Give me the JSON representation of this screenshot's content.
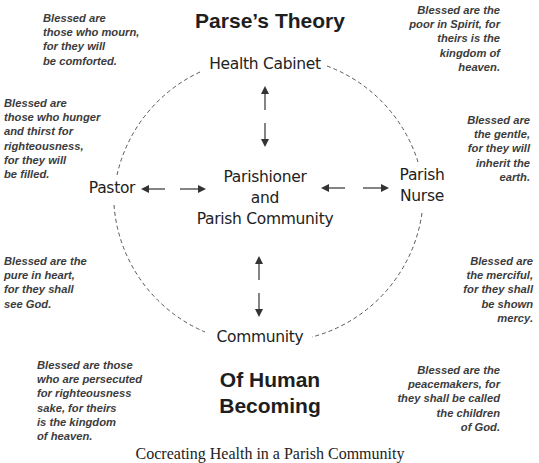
{
  "title_top": "Parse’s Theory",
  "title_bottom": "Of Human\nBecoming",
  "caption": "Cocreating Health in a Parish Community",
  "center_node": "Parishioner\nand\nParish Community",
  "nodes": {
    "top": "Health Cabinet",
    "left": "Pastor",
    "right": "Parish\nNurse",
    "bottom": "Community"
  },
  "beatitudes": {
    "top_left": "Blessed are\nthose who mourn,\nfor they will\nbe comforted.",
    "top_right": "Blessed are the\npoor in Spirit, for\ntheirs is the\nkingdom of\nheaven.",
    "mid_left": "Blessed are\nthose who hunger\nand thirst for\nrighteousness,\nfor they will\nbe filled.",
    "mid_right": "Blessed are\nthe gentle,\nfor they will\ninherit the\nearth.",
    "low_left": "Blessed are the\npure in heart,\nfor they shall\nsee God.",
    "low_right": "Blessed are\nthe merciful,\nfor they shall\nbe shown\nmercy.",
    "bottom_left": "Blessed are those\nwho are persecuted\nfor righteousness\nsake, for theirs\nis the kingdom\nof heaven.",
    "bottom_right": "Blessed are the\npeacemakers, for\nthey shall be called\nthe children\nof God."
  },
  "icons": {
    "arrow_up": "arrow-up-icon",
    "arrow_down": "arrow-down-icon",
    "arrow_left": "arrow-left-icon",
    "arrow_right": "arrow-right-icon"
  },
  "colors": {
    "text": "#222222",
    "beatitude_text": "#3c3c3c",
    "dashed_line": "#555555"
  }
}
